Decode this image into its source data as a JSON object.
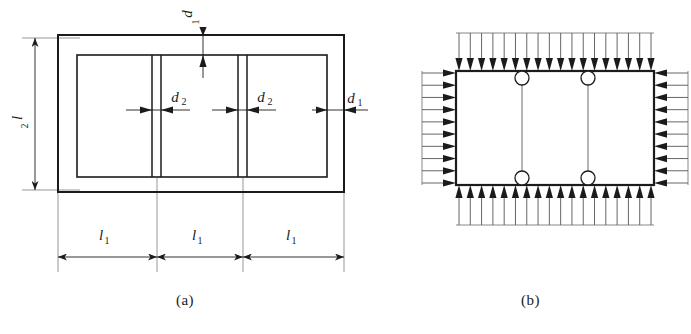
{
  "figure": {
    "panels": [
      {
        "id": "a",
        "caption": "(a)",
        "description": "plan view of rectangular slab with three panels and dimension lines",
        "dimensions": [
          {
            "name": "l2-vertical",
            "symbol": "l",
            "subscript": "2",
            "orientation": "vertical",
            "position": "left"
          },
          {
            "name": "d1-top",
            "symbol": "d",
            "subscript": "1",
            "orientation": "vertical",
            "position": "top-center"
          },
          {
            "name": "d1-right",
            "symbol": "d",
            "subscript": "1",
            "orientation": "horizontal",
            "position": "right"
          },
          {
            "name": "d2-left-rib",
            "symbol": "d",
            "subscript": "2",
            "orientation": "horizontal",
            "position": "inner-left-rib"
          },
          {
            "name": "d2-right-rib",
            "symbol": "d",
            "subscript": "2",
            "orientation": "horizontal",
            "position": "inner-right-rib"
          },
          {
            "name": "l1-bay-1",
            "symbol": "l",
            "subscript": "1",
            "orientation": "horizontal",
            "position": "bottom-left-bay"
          },
          {
            "name": "l1-bay-2",
            "symbol": "l",
            "subscript": "1",
            "orientation": "horizontal",
            "position": "bottom-center-bay"
          },
          {
            "name": "l1-bay-3",
            "symbol": "l",
            "subscript": "1",
            "orientation": "horizontal",
            "position": "bottom-right-bay"
          }
        ]
      },
      {
        "id": "b",
        "caption": "(b)",
        "description": "load diagram with distributed pressure arrows on all four edges and four hinge circles",
        "loads": {
          "top_arrow_count": 18,
          "bottom_arrow_count": 18,
          "left_arrow_count": 10,
          "right_arrow_count": 10,
          "top_direction": "down",
          "bottom_direction": "up",
          "left_direction": "right",
          "right_direction": "left"
        },
        "hinges": 4,
        "internal_ribs": 2
      }
    ]
  },
  "style": {
    "line_color": "#1b1b1b",
    "thin_line_color": "#555555",
    "background": "#ffffff"
  }
}
